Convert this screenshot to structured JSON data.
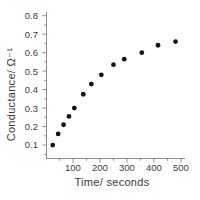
{
  "figure": {
    "background": "#ffffff"
  },
  "chart_data": {
    "type": "scatter",
    "title": "",
    "xlabel": "Time/ seconds",
    "ylabel": "Conductance/ Ω⁻¹",
    "x": [
      25,
      45,
      65,
      85,
      105,
      138,
      168,
      205,
      250,
      290,
      355,
      415,
      480
    ],
    "y": [
      0.1,
      0.16,
      0.21,
      0.255,
      0.3,
      0.375,
      0.43,
      0.48,
      0.535,
      0.565,
      0.6,
      0.64,
      0.66
    ],
    "xlim": [
      0,
      515
    ],
    "ylim": [
      0.03,
      0.82
    ],
    "x_ticks": [
      100,
      200,
      300,
      400,
      500
    ],
    "x_minor_step": 50,
    "y_ticks": [
      0.1,
      0.2,
      0.3,
      0.4,
      0.5,
      0.6,
      0.7,
      0.8
    ],
    "y_tick_labels": [
      "0.1",
      "0.2",
      "0.3",
      "0.4",
      "0.5",
      "0.6",
      "0.7",
      "0.8"
    ],
    "y_minor_step": 0.05,
    "grid": false,
    "legend": null,
    "marker": "filled-circle",
    "marker_radius": 2.4,
    "colors": {
      "marker": "#151515",
      "axis": "#8c8c8c",
      "text": "#3d3d3d",
      "background": "#ffffff"
    }
  }
}
